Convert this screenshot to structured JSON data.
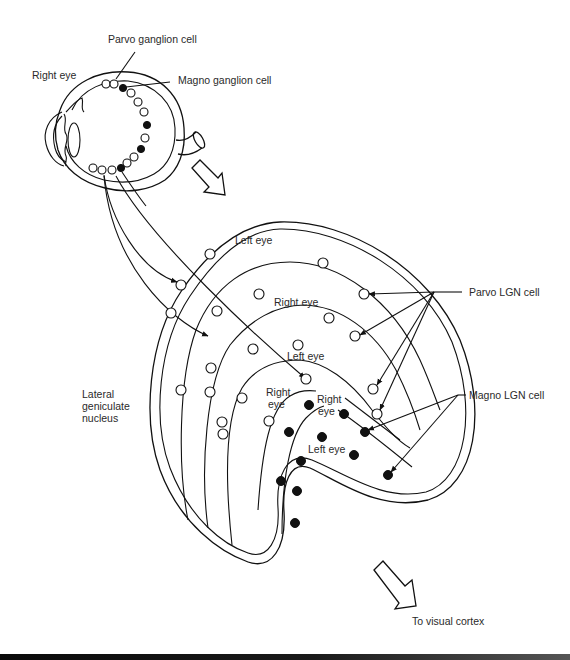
{
  "diagram": {
    "labels": {
      "parvo_ganglion": "Parvo ganglion cell",
      "magno_ganglion": "Magno ganglion cell",
      "right_eye": "Right eye",
      "lgn_line1": "Lateral",
      "lgn_line2": "geniculate",
      "lgn_line3": "nucleus",
      "layer_left_eye_outer": "Left eye",
      "layer_right_eye_2": "Right eye",
      "layer_left_eye_3": "Left eye",
      "layer_right_eye_4_line1": "Right",
      "layer_right_eye_4_line2": "eye",
      "layer_right_eye_5_line1": "Right",
      "layer_right_eye_5_line2": "eye",
      "layer_left_eye_6": "Left eye",
      "parvo_lgn": "Parvo LGN cell",
      "magno_lgn": "Magno LGN cell",
      "to_cortex": "To visual cortex"
    },
    "legend": {
      "open_circle": "Parvo cell",
      "filled_circle": "Magno cell"
    },
    "colors": {
      "ink": "#111111",
      "text": "#2a2a2a",
      "background": "#ffffff"
    }
  }
}
